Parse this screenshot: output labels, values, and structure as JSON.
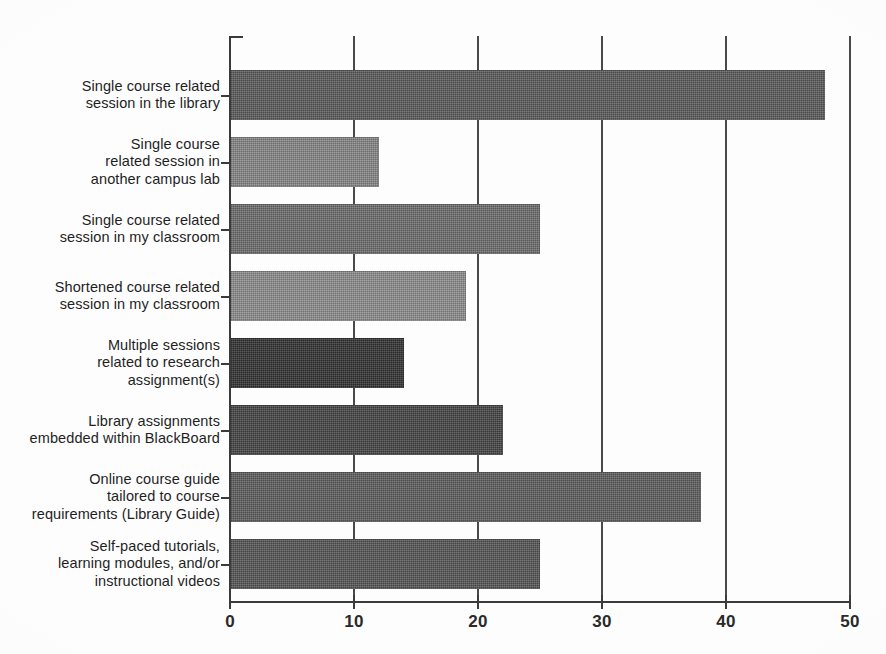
{
  "chart_data": {
    "type": "bar",
    "orientation": "horizontal",
    "title": "",
    "xlabel": "",
    "ylabel": "",
    "xlim": [
      0,
      50
    ],
    "xticks": [
      0,
      10,
      20,
      30,
      40,
      50
    ],
    "xtick_labels": [
      "0",
      "10",
      "20",
      "30",
      "40",
      "50"
    ],
    "grid": "vertical-only",
    "legend": "none",
    "categories": [
      "Single course related session in the library",
      "Single course related session in another campus lab",
      "Single course related session in my classroom",
      "Shortened course related session in my classroom",
      "Multiple sessions related to research assignment(s)",
      "Library assignments embedded within BlackBoard",
      "Online course guide tailored to course requirements (Library Guide)",
      "Self-paced tutorials, learning modules, and/or instructional videos"
    ],
    "category_lines": [
      [
        "Single course related",
        "session in the library"
      ],
      [
        "Single course",
        "related session in",
        "another campus lab"
      ],
      [
        "Single course related",
        "session in my classroom"
      ],
      [
        "Shortened course related",
        "session in my classroom"
      ],
      [
        "Multiple sessions",
        "related to research",
        "assignment(s)"
      ],
      [
        "Library assignments",
        "embedded within BlackBoard"
      ],
      [
        "Online course guide",
        "tailored to course",
        "requirements (Library Guide)"
      ],
      [
        "Self-paced tutorials,",
        "learning modules, and/or",
        "instructional videos"
      ]
    ],
    "values": [
      48,
      12,
      25,
      19,
      14,
      22,
      38,
      25
    ],
    "bar_colors": [
      "#5c5c5c",
      "#878787",
      "#6e6e6e",
      "#8e8e8e",
      "#333333",
      "#454545",
      "#5f5f5f",
      "#565656"
    ]
  },
  "axis": {
    "line_color": "#3b3b3b",
    "grid_color": "#4a4a4a",
    "tick_label_color": "#2a2a2a"
  },
  "labels": {
    "text_color": "#1f1f1f"
  }
}
